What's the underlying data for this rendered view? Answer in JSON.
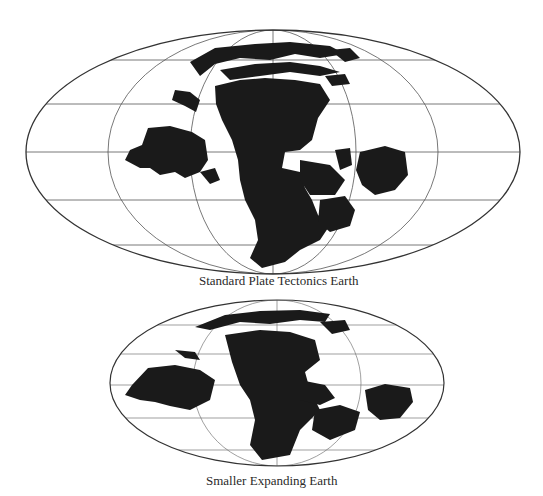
{
  "figures": [
    {
      "id": "standard",
      "caption": "Standard Plate Tectonics Earth",
      "projection": "elliptical world map (Mollweide-like)",
      "colors": {
        "land": "#1a1a1a",
        "ocean": "#ffffff",
        "graticule": "#555555",
        "outline": "#333333"
      }
    },
    {
      "id": "expanding",
      "caption": "Smaller Expanding Earth",
      "projection": "elliptical world map (Mollweide-like)",
      "colors": {
        "land": "#1a1a1a",
        "ocean": "#ffffff",
        "graticule": "#777777",
        "outline": "#333333"
      }
    }
  ]
}
